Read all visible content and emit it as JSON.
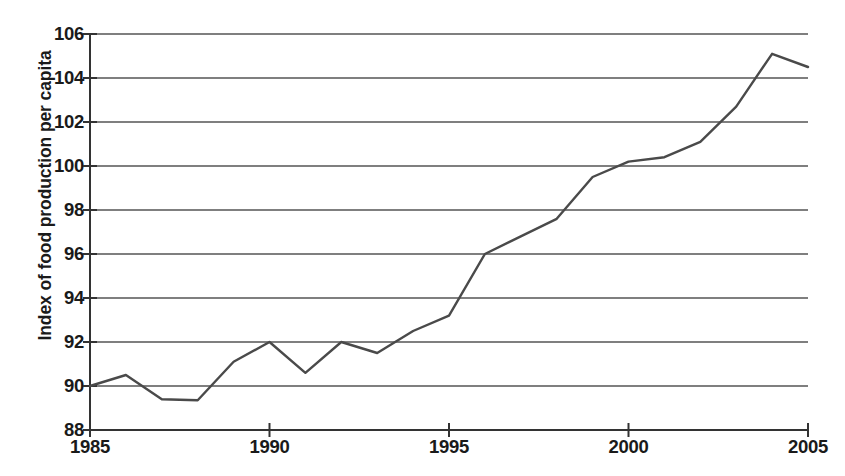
{
  "chart_data": {
    "type": "line",
    "title": "",
    "xlabel": "",
    "ylabel": "Index of food production per capita",
    "xlim": [
      1985,
      2005
    ],
    "ylim": [
      88,
      106
    ],
    "grid": true,
    "legend": false,
    "line_color": "#4a4a4a",
    "x": [
      1985,
      1986,
      1987,
      1988,
      1989,
      1990,
      1991,
      1992,
      1993,
      1994,
      1995,
      1996,
      1997,
      1998,
      1999,
      2000,
      2001,
      2002,
      2003,
      2004,
      2005
    ],
    "values": [
      90.0,
      90.5,
      89.4,
      89.35,
      91.1,
      92.0,
      90.6,
      92.0,
      91.5,
      92.5,
      93.2,
      96.0,
      96.8,
      97.6,
      99.5,
      100.2,
      100.4,
      101.1,
      102.7,
      105.1,
      104.5
    ],
    "series": [
      {
        "name": "Index of food production per capita",
        "values": [
          90.0,
          90.5,
          89.4,
          89.35,
          91.1,
          92.0,
          90.6,
          92.0,
          91.5,
          92.5,
          93.2,
          96.0,
          96.8,
          97.6,
          99.5,
          100.2,
          100.4,
          101.1,
          102.7,
          105.1,
          104.5
        ]
      }
    ],
    "y_ticks": [
      88,
      90,
      92,
      94,
      96,
      98,
      100,
      102,
      104,
      106
    ],
    "y_tick_labels": [
      "88",
      "90",
      "92",
      "94",
      "96",
      "98",
      "100",
      "102",
      "104",
      "106"
    ],
    "x_ticks": [
      1985,
      1990,
      1995,
      2000,
      2005
    ],
    "x_tick_labels": [
      "1985",
      "1990",
      "1995",
      "2000",
      "2005"
    ]
  }
}
